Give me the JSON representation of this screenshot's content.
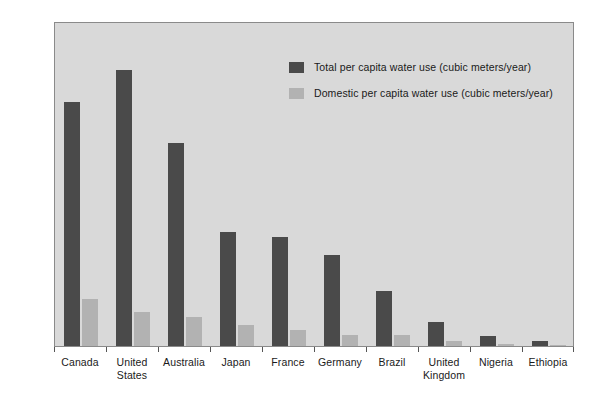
{
  "chart_data": {
    "type": "bar",
    "title": "",
    "subtitle": "",
    "xlabel": "",
    "ylabel": "",
    "ylim": [
      0,
      2000
    ],
    "yticks": [
      0,
      500,
      1000,
      1500,
      2000
    ],
    "ytick_labels": [
      "0",
      "500",
      "1000",
      "1500",
      "2000"
    ],
    "grid": false,
    "legend_position": "top-right",
    "categories": [
      "Canada",
      "United\nStates",
      "Australia",
      "Japan",
      "France",
      "Germany",
      "Brazil",
      "United\nKingdom",
      "Nigeria",
      "Ethiopia"
    ],
    "series": [
      {
        "name": "Total per capita water use (cubic meters/year)",
        "color": "#4a4a4a",
        "values": [
          1500,
          1700,
          1250,
          700,
          670,
          560,
          340,
          150,
          60,
          30
        ]
      },
      {
        "name": "Domestic per capita water use (cubic meters/year)",
        "color": "#b2b2b2",
        "values": [
          290,
          210,
          180,
          130,
          100,
          70,
          70,
          30,
          10,
          5
        ]
      }
    ]
  },
  "colors": {
    "plot_background": "#d9d9d9",
    "page_background": "#ffffff",
    "axis": "#555555",
    "frame": "#8a8a8a",
    "total_series": "#4a4a4a",
    "domestic_series": "#b2b2b2"
  }
}
